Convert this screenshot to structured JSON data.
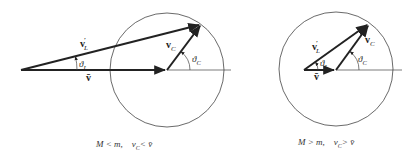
{
  "left_diagram": {
    "labels": {
      "v_L_prime": "v",
      "v_L_prime_sub": "L",
      "v_L_prime_sup": "′",
      "theta_L": "ϑ",
      "theta_L_sub": "L",
      "v_bar": "v̄",
      "v_C": "v",
      "v_C_sub": "C",
      "theta_C": "ϑ",
      "theta_C_sub": "C"
    },
    "caption": "M < m,    v_C < v̄",
    "caption_parts": {
      "cond1": "M < m,",
      "cond2a": "v",
      "cond2_sub": "C",
      "cond2b": "< v̄"
    }
  },
  "right_diagram": {
    "labels": {
      "v_L_prime": "v",
      "v_L_prime_sub": "L",
      "v_L_prime_sup": "′",
      "theta_L": "ϑ",
      "theta_L_sub": "L",
      "v_bar": "v̄",
      "v_C": "v",
      "v_C_sub": "C",
      "theta_C": "ϑ",
      "theta_C_sub": "C"
    },
    "caption": "M > m,    v_C > v̄",
    "caption_parts": {
      "cond1": "M > m,",
      "cond2a": "v",
      "cond2_sub": "C",
      "cond2b": "> v̄"
    }
  },
  "colors": {
    "stroke": "#222222",
    "circle": "#444444",
    "background": "#ffffff"
  }
}
